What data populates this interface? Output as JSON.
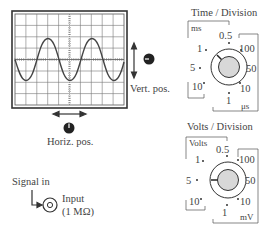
{
  "scope": {
    "grid_cols": 10,
    "grid_rows": 8,
    "waveform": "sine",
    "cycles_visible": 2.5,
    "amplitude_divisions": 2
  },
  "labels": {
    "vert_pos": "Vert. pos.",
    "horiz_pos": "Horiz. pos.",
    "signal_in": "Signal in",
    "input": "Input",
    "input_impedance": "(1 MΩ)"
  },
  "time_dial": {
    "title": "Time / Division",
    "unit_upper": "ms",
    "unit_lower": "μs",
    "ticks": [
      "0.5",
      "1",
      "5",
      "10",
      "1",
      "10",
      "50",
      "100"
    ],
    "selected": "1 ms"
  },
  "volts_dial": {
    "title": "Volts / Division",
    "unit_upper": "Volts",
    "unit_lower": "mV",
    "ticks": [
      "0.5",
      "1",
      "5",
      "10",
      "1",
      "10",
      "50",
      "100"
    ],
    "selected": "5 V"
  }
}
